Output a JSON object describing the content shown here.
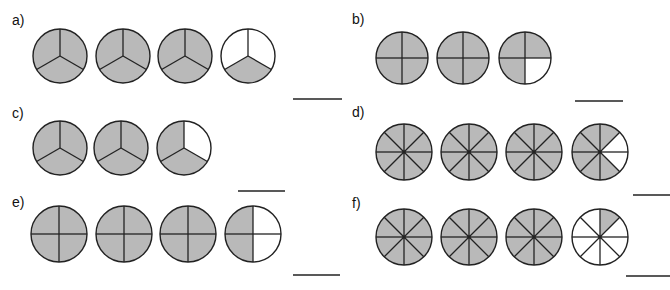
{
  "worksheet": {
    "fill_color": "#b9b9b9",
    "empty_color": "#ffffff",
    "stroke_color": "#222222",
    "problems": [
      {
        "id": "a",
        "label": "a)",
        "label_pos": [
          12,
          25
        ],
        "divisions": 3,
        "answer_line": {
          "x1": 293,
          "x2": 342,
          "y": 99
        },
        "circles": [
          {
            "cx": 60,
            "cy": 56,
            "r": 27,
            "shaded": [
              0,
              1,
              2
            ]
          },
          {
            "cx": 123,
            "cy": 56,
            "r": 27,
            "shaded": [
              0,
              1,
              2
            ]
          },
          {
            "cx": 185,
            "cy": 56,
            "r": 27,
            "shaded": [
              0,
              1,
              2
            ]
          },
          {
            "cx": 248,
            "cy": 56,
            "r": 27,
            "shaded": [
              1
            ]
          }
        ]
      },
      {
        "id": "b",
        "label": "b)",
        "label_pos": [
          352,
          24
        ],
        "divisions": 4,
        "answer_line": {
          "x1": 575,
          "x2": 623,
          "y": 101
        },
        "circles": [
          {
            "cx": 402,
            "cy": 58,
            "r": 26,
            "shaded": [
              0,
              1,
              2,
              3
            ]
          },
          {
            "cx": 463,
            "cy": 58,
            "r": 26,
            "shaded": [
              0,
              1,
              2,
              3
            ]
          },
          {
            "cx": 525,
            "cy": 58,
            "r": 26,
            "shaded": [
              0,
              2,
              3
            ]
          }
        ]
      },
      {
        "id": "c",
        "label": "c)",
        "label_pos": [
          12,
          118
        ],
        "divisions": 3,
        "answer_line": {
          "x1": 238,
          "x2": 285,
          "y": 191
        },
        "circles": [
          {
            "cx": 60,
            "cy": 148,
            "r": 27,
            "shaded": [
              0,
              1,
              2
            ]
          },
          {
            "cx": 121,
            "cy": 148,
            "r": 27,
            "shaded": [
              0,
              1,
              2
            ]
          },
          {
            "cx": 184,
            "cy": 148,
            "r": 27,
            "shaded": [
              1,
              2
            ]
          }
        ]
      },
      {
        "id": "d",
        "label": "d)",
        "label_pos": [
          352,
          117
        ],
        "divisions": 8,
        "answer_line": {
          "x1": 633,
          "x2": 670,
          "y": 195
        },
        "circles": [
          {
            "cx": 404,
            "cy": 152,
            "r": 28,
            "shaded": [
              0,
              1,
              2,
              3,
              4,
              5,
              6,
              7
            ]
          },
          {
            "cx": 469,
            "cy": 152,
            "r": 28,
            "shaded": [
              0,
              1,
              2,
              3,
              4,
              5,
              6,
              7
            ]
          },
          {
            "cx": 534,
            "cy": 152,
            "r": 28,
            "shaded": [
              0,
              1,
              2,
              3,
              4,
              5,
              6,
              7
            ]
          },
          {
            "cx": 600,
            "cy": 152,
            "r": 28,
            "shaded": [
              0,
              3,
              4,
              5,
              6,
              7
            ]
          }
        ]
      },
      {
        "id": "e",
        "label": "e)",
        "label_pos": [
          12,
          207
        ],
        "divisions": 4,
        "answer_line": {
          "x1": 293,
          "x2": 340,
          "y": 275
        },
        "circles": [
          {
            "cx": 59,
            "cy": 234,
            "r": 28,
            "shaded": [
              0,
              1,
              2,
              3
            ]
          },
          {
            "cx": 124,
            "cy": 234,
            "r": 28,
            "shaded": [
              0,
              1,
              2,
              3
            ]
          },
          {
            "cx": 188,
            "cy": 234,
            "r": 28,
            "shaded": [
              0,
              1,
              2,
              3
            ]
          },
          {
            "cx": 253,
            "cy": 234,
            "r": 28,
            "shaded": [
              2,
              3
            ]
          }
        ]
      },
      {
        "id": "f",
        "label": "f)",
        "label_pos": [
          352,
          208
        ],
        "divisions": 8,
        "answer_line": {
          "x1": 626,
          "x2": 670,
          "y": 276
        },
        "circles": [
          {
            "cx": 404,
            "cy": 237,
            "r": 28,
            "shaded": [
              0,
              1,
              2,
              3,
              4,
              5,
              6,
              7
            ]
          },
          {
            "cx": 469,
            "cy": 237,
            "r": 28,
            "shaded": [
              0,
              1,
              2,
              3,
              4,
              5,
              6,
              7
            ]
          },
          {
            "cx": 534,
            "cy": 237,
            "r": 28,
            "shaded": [
              0,
              1,
              2,
              3,
              4,
              5,
              6,
              7
            ]
          },
          {
            "cx": 600,
            "cy": 237,
            "r": 28,
            "shaded": [
              0
            ]
          }
        ]
      }
    ]
  }
}
